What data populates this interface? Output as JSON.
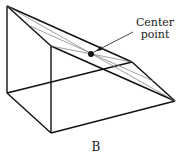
{
  "diagram": {
    "annotation": {
      "line1": "Center",
      "line2": "point"
    },
    "caption": "B",
    "vertices": {
      "top_left": [
        7,
        6
      ],
      "inner_top": [
        51,
        46
      ],
      "right_top": [
        132,
        62
      ],
      "right_far": [
        175,
        101
      ],
      "bottom_left": [
        7,
        93
      ],
      "bottom_front": [
        51,
        133
      ]
    },
    "center_point": [
      91,
      54
    ]
  }
}
